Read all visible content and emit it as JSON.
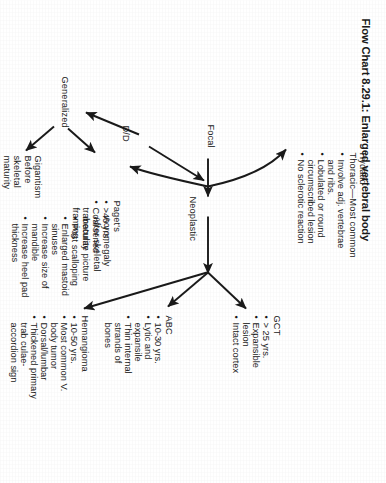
{
  "figure": {
    "title": "Flow Chart 8.29.1: Enlarged vertebral body",
    "root_label": "D/D"
  },
  "branches": {
    "generalized": {
      "label": "Generalized",
      "children": {
        "gigantism": {
          "label": "Gigantism",
          "subtitle": "Before skeletal maturity",
          "bullets": []
        },
        "acromegaly": {
          "label": "Acromegaly",
          "subtitle": "After skeletal maturity",
          "bullets": [
            "Post scalloping",
            "Enlarged mastoid sinuses",
            "Increase size of mandible",
            "Increase heel pad thickness"
          ]
        }
      }
    },
    "focal": {
      "label": "Focal",
      "children": {
        "hydatid": {
          "label": "Hydatid",
          "subtitle": "Thoracic—Most common",
          "bullets": [
            "Involve adj. vertebrae and ribs.",
            "Lobulated or round circumscribed lesion",
            "No sclerotic reaction"
          ]
        },
        "pagets": {
          "label": "Paget's",
          "subtitle": "",
          "bullets": [
            ">40 yrs.",
            "Coarsened trabeculae picture framing"
          ]
        },
        "neoplastic": {
          "label": "Neoplastic",
          "children": {
            "gct": {
              "label": "GCT",
              "bullets": [
                "> 25 yrs.",
                "Expansible lesion",
                "Intact cortex"
              ]
            },
            "abc": {
              "label": "ABC",
              "bullets": [
                "10-30 yrs.",
                "Lytic and expansile",
                "Thin internal strands of bones"
              ]
            },
            "hemangioma": {
              "label": "Hemangioma",
              "bullets": [
                "10-50 yrs.",
                "Most common V. body tumor",
                "Dorsal/lumbar",
                "Thickened primary trab culae- accordion sign"
              ]
            }
          }
        }
      }
    }
  },
  "colors": {
    "ink": "#1a1a1a",
    "paper": "#ffffff"
  }
}
